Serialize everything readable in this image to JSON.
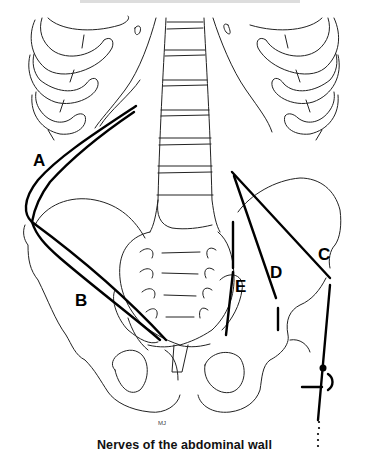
{
  "caption": "Nerves of the abdominal wall",
  "labels": {
    "A": "A",
    "B": "B",
    "C": "C",
    "D": "D",
    "E": "E"
  },
  "signature": "MJ",
  "colors": {
    "background": "#ffffff",
    "line": "#000000"
  }
}
